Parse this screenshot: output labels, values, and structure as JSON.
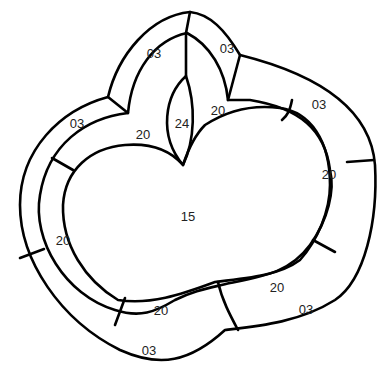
{
  "diagram": {
    "type": "region-map",
    "colors": {
      "stroke": "#000000",
      "background": "#ffffff",
      "label": "#222222"
    },
    "regions": [
      {
        "id": "center",
        "code": "15"
      },
      {
        "id": "top-leaf",
        "code": "24"
      },
      {
        "id": "top-left-cap",
        "code": "03"
      },
      {
        "id": "top-right-cap",
        "code": "03"
      },
      {
        "id": "outer-left-upper",
        "code": "03"
      },
      {
        "id": "outer-right-upper",
        "code": "03"
      },
      {
        "id": "outer-right-lower",
        "code": "03"
      },
      {
        "id": "outer-bottom",
        "code": "03"
      },
      {
        "id": "middle-top-left",
        "code": "20"
      },
      {
        "id": "middle-top-right",
        "code": "20"
      },
      {
        "id": "middle-left",
        "code": "20"
      },
      {
        "id": "middle-right",
        "code": "20"
      },
      {
        "id": "middle-bottom-left",
        "code": "20"
      },
      {
        "id": "middle-bottom-right",
        "code": "20"
      }
    ]
  }
}
